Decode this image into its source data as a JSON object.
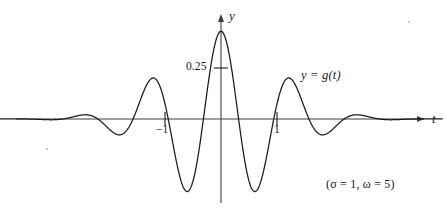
{
  "figure": {
    "background_color": "#ffffff",
    "line_color": "#1a1a1a"
  },
  "axes": {
    "y_axis_label": "y",
    "t_axis_label": "t",
    "y_tick": {
      "label": "0.25",
      "value": 0.25
    },
    "x_ticks": [
      {
        "label": "−1",
        "value": -1
      },
      {
        "label": "1",
        "value": 1
      }
    ]
  },
  "annotations": {
    "curve_label": "y = g(t)",
    "parameters": "(σ = 1,  ω = 5)"
  },
  "chart_data": {
    "type": "line",
    "title": "",
    "xlabel": "t",
    "ylabel": "y",
    "xlim": [
      -3.95,
      3.95
    ],
    "ylim": [
      -0.36,
      0.46
    ],
    "grid": false,
    "legend": "none",
    "series": [
      {
        "name": "y = g(t)",
        "expression": "g(t) = 0.43 * exp(-t^2/2) * cos(5t)",
        "parameters": {
          "sigma": 1,
          "omega": 5,
          "amplitude": 0.43
        },
        "x": [
          -3.95,
          -3.8,
          -3.65,
          -3.5,
          -3.35,
          -3.2,
          -3.05,
          -2.9,
          -2.75,
          -2.6,
          -2.45,
          -2.3,
          -2.15,
          -2.0,
          -1.85,
          -1.7,
          -1.55,
          -1.4,
          -1.25,
          -1.1,
          -0.95,
          -0.8,
          -0.65,
          -0.5,
          -0.35,
          -0.2,
          -0.05,
          0.0,
          0.05,
          0.2,
          0.35,
          0.5,
          0.65,
          0.8,
          0.95,
          1.1,
          1.25,
          1.4,
          1.55,
          1.7,
          1.85,
          2.0,
          2.15,
          2.3,
          2.45,
          2.6,
          2.75,
          2.9,
          3.05,
          3.2,
          3.35,
          3.5,
          3.65,
          3.8,
          3.95
        ],
        "y": [
          0.0,
          0.0,
          0.001,
          0.002,
          0.002,
          -0.001,
          -0.004,
          -0.005,
          -0.002,
          0.004,
          0.009,
          0.009,
          0.001,
          -0.012,
          -0.022,
          -0.021,
          -0.003,
          0.026,
          0.047,
          0.044,
          0.005,
          -0.056,
          -0.106,
          -0.107,
          -0.035,
          0.102,
          0.251,
          0.43,
          0.251,
          0.102,
          -0.035,
          -0.107,
          -0.106,
          -0.056,
          0.005,
          0.044,
          0.047,
          0.026,
          -0.003,
          -0.021,
          -0.022,
          -0.012,
          0.001,
          0.009,
          0.009,
          0.004,
          -0.002,
          -0.005,
          -0.004,
          -0.001,
          0.002,
          0.002,
          0.001,
          0.0,
          0.0
        ]
      }
    ],
    "key_points": {
      "central_peak": {
        "t": 0,
        "y": 0.43
      },
      "first_side_minima": [
        {
          "t": -0.63,
          "y": -0.29
        },
        {
          "t": 0.63,
          "y": -0.29
        }
      ],
      "second_side_maxima": [
        {
          "t": -1.26,
          "y": 0.135
        },
        {
          "t": 1.26,
          "y": 0.135
        }
      ],
      "third_side_minima": [
        {
          "t": -1.88,
          "y": -0.045
        },
        {
          "t": 1.88,
          "y": -0.045
        }
      ],
      "fourth_side_maxima": [
        {
          "t": -2.51,
          "y": 0.015
        },
        {
          "t": 2.51,
          "y": 0.015
        }
      ]
    }
  }
}
